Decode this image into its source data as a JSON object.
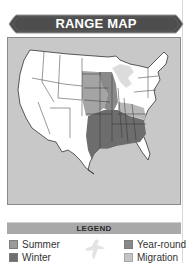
{
  "header": {
    "title": "RANGE MAP"
  },
  "map": {
    "region": "United States (contiguous)",
    "colors": {
      "ocean": "#c8c8c8",
      "land": "#ffffff",
      "summer": "#9a9a9a",
      "winter": "#6f6f6f",
      "year_round": "#888888",
      "migration": "#bdbdbd",
      "great_lakes": "#dcdcdc"
    }
  },
  "legend": {
    "title": "LEGEND",
    "items": [
      {
        "label": "Summer",
        "color": "#9a9a9a"
      },
      {
        "label": "Winter",
        "color": "#6f6f6f"
      },
      {
        "label": "Year-round",
        "color": "#888888"
      },
      {
        "label": "Migration",
        "color": "#c4c4c4"
      }
    ],
    "icon": "bird-silhouette-icon"
  }
}
